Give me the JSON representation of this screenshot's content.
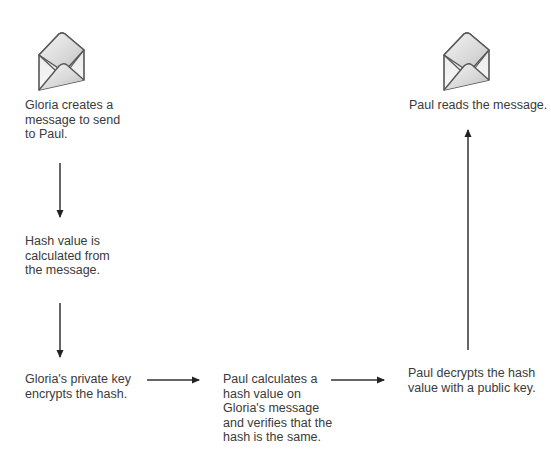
{
  "diagram": {
    "type": "flow",
    "steps": [
      {
        "id": "create",
        "lines": [
          "Gloria creates a",
          "message to send",
          "to Paul."
        ],
        "icon": "envelope-icon"
      },
      {
        "id": "hash",
        "lines": [
          "Hash value is",
          "calculated from",
          "the message."
        ]
      },
      {
        "id": "encrypt",
        "lines": [
          "Gloria's private key",
          "encrypts the hash."
        ]
      },
      {
        "id": "verify",
        "lines": [
          "Paul calculates a",
          "hash value on",
          "Gloria's message",
          "and verifies that the",
          "hash is the same."
        ]
      },
      {
        "id": "decrypt",
        "lines": [
          "Paul decrypts the hash",
          "value with a public key."
        ]
      },
      {
        "id": "read",
        "lines": [
          "Paul reads the message."
        ],
        "icon": "envelope-icon"
      }
    ],
    "arrows": [
      {
        "from": "create",
        "to": "hash",
        "direction": "down"
      },
      {
        "from": "hash",
        "to": "encrypt",
        "direction": "down"
      },
      {
        "from": "encrypt",
        "to": "verify",
        "direction": "right"
      },
      {
        "from": "verify",
        "to": "decrypt",
        "direction": "right"
      },
      {
        "from": "decrypt",
        "to": "read",
        "direction": "up"
      }
    ]
  }
}
